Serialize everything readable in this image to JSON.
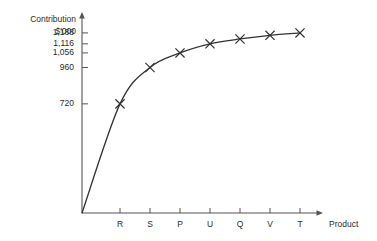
{
  "chart_data": {
    "type": "line",
    "title": "",
    "subtitle": "",
    "ylabel_line1": "Contribution",
    "ylabel_line2": "$'000",
    "xlabel": "Product",
    "categories": [
      "R",
      "S",
      "P",
      "U",
      "Q",
      "V",
      "T"
    ],
    "values": [
      720,
      960,
      1056,
      1116,
      1148,
      1172,
      1188
    ],
    "series": [
      {
        "name": "Cumulative contribution",
        "values": [
          720,
          960,
          1056,
          1116,
          1148,
          1172,
          1188
        ],
        "marker": "x-cross",
        "line_color": "#333333"
      }
    ],
    "y_tick_labels": [
      "1,188",
      "1,116",
      "1,056",
      "960",
      "720"
    ],
    "y_tick_values": [
      1188,
      1116,
      1056,
      960,
      720
    ],
    "ylim": [
      0,
      1260
    ],
    "grid": false,
    "legend": "none",
    "axis_arrows": true,
    "origin_label": ""
  },
  "colors": {
    "line": "#333333",
    "axis": "#555555",
    "text": "#2b2b2b",
    "background": "#ffffff"
  }
}
